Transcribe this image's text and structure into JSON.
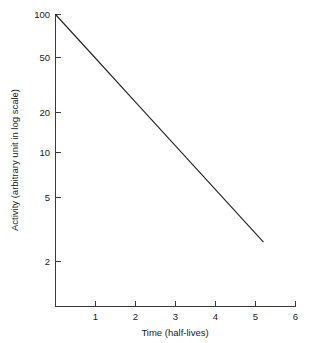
{
  "chart_data": {
    "type": "line",
    "title": "",
    "xlabel": "Time (half-lives)",
    "ylabel": "Activity (arbitrary unit in log scale)",
    "yscale": "log",
    "xscale": "linear",
    "xlim": [
      0,
      6
    ],
    "ylim": [
      1.6,
      100
    ],
    "xticks": [
      1,
      2,
      3,
      4,
      5,
      6
    ],
    "xticklabels": [
      "1",
      "2",
      "3",
      "4",
      "5",
      "6"
    ],
    "yticks": [
      2,
      5,
      10,
      20,
      50,
      100
    ],
    "yticklabels": [
      "2",
      "5",
      "10",
      "20",
      "50",
      "100"
    ],
    "grid": false,
    "legend": false,
    "series": [
      {
        "name": "radioactive decay",
        "x": [
          0,
          1,
          2,
          3,
          4,
          5,
          5.2
        ],
        "y": [
          100,
          50,
          25,
          12.5,
          6.25,
          3.125,
          2.72
        ]
      }
    ]
  },
  "axes": {
    "y_title": "Activity (arbitrary unit in log scale)",
    "x_title": "Time (half-lives)",
    "y_tick_labels": [
      "100",
      "50",
      "20",
      "10",
      "5",
      "2"
    ],
    "x_tick_labels": [
      "1",
      "2",
      "3",
      "4",
      "5",
      "6"
    ]
  },
  "colors": {
    "background": "#ffffff",
    "axis": "#3a3a3a",
    "line": "#262626",
    "text": "#1a1a1a"
  }
}
